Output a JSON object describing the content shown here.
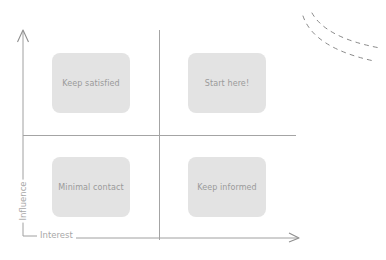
{
  "diagram": {
    "type": "stakeholder-matrix",
    "axes": {
      "y_label": "Influence",
      "x_label": "Interest"
    },
    "quadrants": {
      "top_left": "Keep satisfied",
      "top_right": "Start here!",
      "bottom_left": "Minimal contact",
      "bottom_right": "Keep informed"
    },
    "colors": {
      "box_fill": "#e3e3e3",
      "box_text": "#9a9a9a",
      "line": "#9e9e9e",
      "axis_label": "#a8a8a8",
      "decoration": "#8a8a8a"
    }
  }
}
